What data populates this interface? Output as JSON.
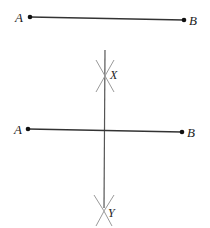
{
  "figure": {
    "colors": {
      "segment": "#333333",
      "bisector": "#555555",
      "arcs": "#9a9a9a",
      "points": "#111111"
    },
    "top_segment": {
      "label_a": "A",
      "label_b": "B"
    },
    "construction": {
      "label_a": "A",
      "label_b": "B",
      "intersection_upper": "X",
      "intersection_lower": "Y"
    }
  }
}
